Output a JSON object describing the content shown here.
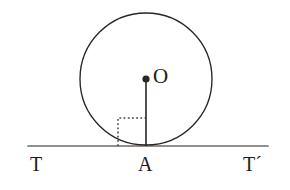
{
  "figure": {
    "background_color": "#ffffff",
    "width": 290,
    "height": 190,
    "stroke_color": "#2b2522",
    "tangent_color": "#6e6a66",
    "marker_color": "#4a4340"
  },
  "labels": {
    "center": "O",
    "tangent_point": "A",
    "tangent_left": "T",
    "tangent_right": "T´"
  },
  "geometry": {
    "circle": {
      "center_x": 146,
      "center_y": 79,
      "radius": 66
    },
    "center_dot": {
      "x": 146,
      "y": 79,
      "r": 3.6
    },
    "radius_segment": {
      "x1": 146,
      "y1": 79,
      "x2": 146,
      "y2": 146
    },
    "tangent_line": {
      "x1": 28,
      "y1": 146,
      "x2": 268,
      "y2": 146
    },
    "right_angle_marker": {
      "x": 118,
      "y": 118,
      "size": 28,
      "style": "dotted"
    }
  }
}
